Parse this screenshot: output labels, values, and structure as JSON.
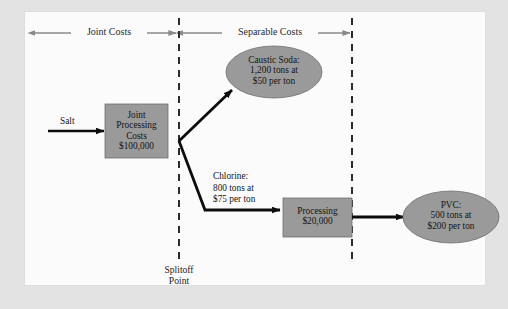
{
  "canvas": {
    "width": 508,
    "height": 309,
    "page_background": "#e3e3e3",
    "panel_background": "#fbfbfb",
    "shape_fill": "#9a9a9a",
    "shape_stroke": "#6f6f6f",
    "arrow_color": "#0d0d0d",
    "band_arrow_color": "#8a8a8a",
    "divider_color": "#2b2b2b"
  },
  "bands": [
    {
      "id": "joint",
      "label": "Joint Costs"
    },
    {
      "id": "separable",
      "label": "Separable Costs"
    }
  ],
  "dividers": [
    {
      "id": "splitoff-line",
      "caption": "Splitoff\nPoint"
    },
    {
      "id": "right-line",
      "caption": ""
    }
  ],
  "inflow": {
    "label": "Salt"
  },
  "nodes": [
    {
      "id": "joint-processing-costs",
      "shape": "box",
      "label": "Joint\nProcessing\nCosts\n$100,000"
    },
    {
      "id": "caustic-soda",
      "shape": "ellipse",
      "label": "Caustic Soda:\n1,200 tons at\n$50 per ton"
    },
    {
      "id": "processing",
      "shape": "box",
      "label": "Processing\n$20,000"
    },
    {
      "id": "pvc",
      "shape": "ellipse",
      "label": "PVC:\n500 tons at\n$200 per ton"
    }
  ],
  "flows": [
    {
      "id": "chlorine-flow",
      "label": "Chlorine:\n800 tons at\n$75 per ton"
    }
  ]
}
